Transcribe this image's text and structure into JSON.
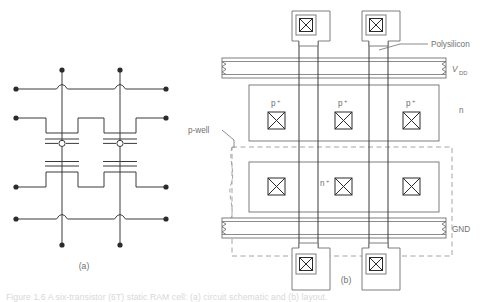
{
  "figure": {
    "panel_a_label": "(a)",
    "panel_b_label": "(b)",
    "caption": "Figure 1.6    A six-transistor (6T) static RAM cell: (a) circuit schematic and (b) layout."
  },
  "colors": {
    "line": "#3a3a3a",
    "line_light": "#8a8a8a",
    "label": "#6f6f6f",
    "dashed": "#9a9a9a",
    "fill": "#ffffff",
    "caption": "#d8d8d8"
  },
  "panel_a": {
    "name": "circuit-schematic",
    "description": "Cross-coupled CMOS inverter pair schematic with four terminal dots on the left, four on the right, and two on top and bottom of each vertical rail.",
    "transistor_count": 4,
    "vertical_rails": 2,
    "horizontal_wires": 4,
    "terminal_dots": 12
  },
  "panel_b": {
    "name": "layout-diagram",
    "labels": {
      "polysilicon": "Polysilicon",
      "vdd": "V",
      "vdd_sub": "DD",
      "gnd": "GND",
      "pwell": "p-well",
      "n_region": "n",
      "p_plus": "p",
      "p_plus_sup": "+",
      "n_plus": "n",
      "n_plus_sup": "+"
    },
    "p_plus_contacts": 3,
    "n_plus_contacts": 3,
    "top_pads": 2,
    "bottom_pads": 2,
    "poly_columns": 4
  }
}
